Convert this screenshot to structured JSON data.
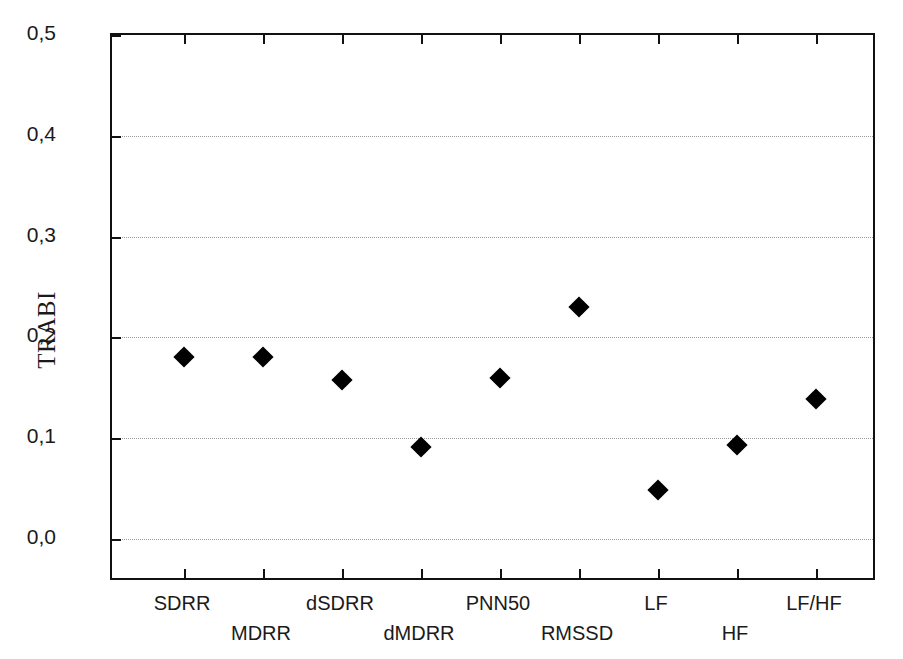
{
  "chart_data": {
    "type": "scatter",
    "title": "",
    "xlabel": "",
    "ylabel": "TRABI",
    "ylim": [
      0.0,
      0.5
    ],
    "ytick_labels": [
      "0,0",
      "0,1",
      "0,2",
      "0,3",
      "0,4",
      "0,5"
    ],
    "ytick_values": [
      0.0,
      0.1,
      0.2,
      0.3,
      0.4,
      0.5
    ],
    "grid": true,
    "grid_axis": "y",
    "legend": "none",
    "decimal_separator": ",",
    "marker_style": "filled-diamond",
    "marker_color": "#000000",
    "categories": [
      "SDRR",
      "MDRR",
      "dSDRR",
      "dMDRR",
      "PNN50",
      "RMSSD",
      "LF",
      "HF",
      "LF/HF"
    ],
    "values": [
      0.181,
      0.181,
      0.158,
      0.091,
      0.16,
      0.23,
      0.049,
      0.093,
      0.139
    ],
    "points": [
      {
        "category": "SDRR",
        "value": 0.181,
        "label_row": 0
      },
      {
        "category": "MDRR",
        "value": 0.181,
        "label_row": 1
      },
      {
        "category": "dSDRR",
        "value": 0.158,
        "label_row": 0
      },
      {
        "category": "dMDRR",
        "value": 0.091,
        "label_row": 1
      },
      {
        "category": "PNN50",
        "value": 0.16,
        "label_row": 0
      },
      {
        "category": "RMSSD",
        "value": 0.23,
        "label_row": 1
      },
      {
        "category": "LF",
        "value": 0.049,
        "label_row": 0
      },
      {
        "category": "HF",
        "value": 0.093,
        "label_row": 1
      },
      {
        "category": "LF/HF",
        "value": 0.139,
        "label_row": 0
      }
    ]
  }
}
